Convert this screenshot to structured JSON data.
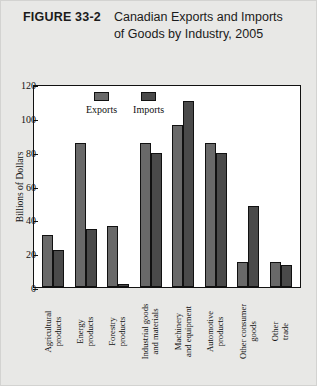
{
  "figure": {
    "number": "FIGURE 33-2",
    "title": "Canadian Exports and Imports of Goods by Industry, 2005"
  },
  "colors": {
    "card_background": "#e8e8e6",
    "plot_background": "#ffffff",
    "axis": "#111111",
    "exports": "#696969",
    "imports": "#4a4a4a"
  },
  "chart_data": {
    "type": "bar",
    "title": "Canadian Exports and Imports of Goods by Industry, 2005",
    "xlabel": "",
    "ylabel": "Billions of Dollars",
    "ylim": [
      0,
      120
    ],
    "yticks": [
      0,
      20,
      40,
      60,
      80,
      100,
      120
    ],
    "grid": false,
    "legend_position": "top-left-inside",
    "categories": [
      "Agricultural products",
      "Energy products",
      "Forestry products",
      "Industrial goods and materials",
      "Machinery and equipment",
      "Automotive products",
      "Other consumer goods",
      "Other trade"
    ],
    "series": [
      {
        "name": "Exports",
        "values": [
          31,
          85,
          36,
          85,
          96,
          85,
          15,
          15
        ]
      },
      {
        "name": "Imports",
        "values": [
          22,
          34,
          2,
          79,
          110,
          79,
          48,
          13
        ]
      }
    ]
  }
}
